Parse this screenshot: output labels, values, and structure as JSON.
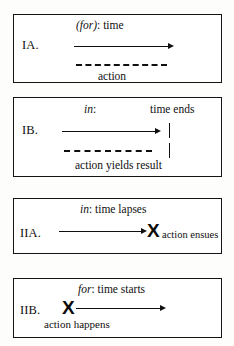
{
  "figure": {
    "background_color": "#fdfdfc",
    "ink_color": "#141414"
  },
  "panels": [
    {
      "id": "IA",
      "label": "IA.",
      "caption_italic": "(for)",
      "caption_rest": ": time",
      "timeline_type": "solid-arrow",
      "action_line_type": "dashed",
      "action_label": "action",
      "boundary_marks": 0
    },
    {
      "id": "IB",
      "label": "IB.",
      "caption_italic": "in",
      "caption_rest": ":",
      "caption_right": "time ends",
      "timeline_type": "solid-arrow",
      "action_line_type": "dashed",
      "action_label": "action  yields  result",
      "boundary_marks": 2
    },
    {
      "id": "IIA",
      "label": "IIA.",
      "caption_italic": "in",
      "caption_rest": ":  time lapses",
      "timeline_type": "solid-arrow",
      "endpoint_glyph": "X",
      "action_label": "action ensues",
      "glyph_position": "end"
    },
    {
      "id": "IIB",
      "label": "IIB.",
      "caption_italic": "for",
      "caption_rest": ": time starts",
      "timeline_type": "solid-arrow",
      "endpoint_glyph": "X",
      "action_label": "action happens",
      "glyph_position": "start"
    }
  ]
}
